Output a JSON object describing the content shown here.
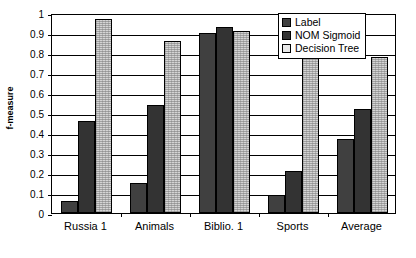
{
  "chart_data": {
    "type": "bar",
    "title": "",
    "xlabel": "",
    "ylabel": "f-measure",
    "ylim": [
      0,
      1
    ],
    "yticks": [
      "0",
      "0.1",
      "0.2",
      "0.3",
      "0.4",
      "0.5",
      "0.6",
      "0.7",
      "0.8",
      "0.9",
      "1"
    ],
    "ytick_values": [
      0,
      0.1,
      0.2,
      0.3,
      0.4,
      0.5,
      0.6,
      0.7,
      0.8,
      0.9,
      1
    ],
    "grid": true,
    "legend_position": "top-right",
    "categories": [
      "Russia 1",
      "Animals",
      "Biblio. 1",
      "Sports",
      "Average"
    ],
    "series": [
      {
        "name": "Label",
        "values": [
          0.06,
          0.15,
          0.9,
          0.09,
          0.37
        ],
        "color": "#404040"
      },
      {
        "name": "NOM Sigmoid",
        "values": [
          0.46,
          0.54,
          0.93,
          0.21,
          0.52
        ],
        "color": "#333333"
      },
      {
        "name": "Decision Tree",
        "values": [
          0.97,
          0.86,
          0.91,
          0.82,
          0.78
        ],
        "color": "#d4d4d4"
      }
    ]
  },
  "legend": {
    "items": [
      {
        "label": "Label"
      },
      {
        "label": "NOM Sigmoid"
      },
      {
        "label": "Decision Tree"
      }
    ]
  }
}
